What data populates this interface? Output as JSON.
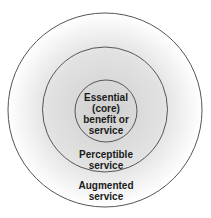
{
  "diagram": {
    "type": "concentric-circles",
    "layers": [
      {
        "name": "outer",
        "lines": [
          "Augmented",
          "service"
        ]
      },
      {
        "name": "middle",
        "lines": [
          "Perceptible",
          "service"
        ]
      },
      {
        "name": "inner",
        "lines": [
          "Essential",
          "(core)",
          "benefit or",
          "service"
        ]
      }
    ],
    "colors": {
      "stroke": "#555555",
      "fill_center": "#d4d4d4",
      "fill_edge": "#ffffff",
      "text": "#1a1a1a"
    }
  }
}
